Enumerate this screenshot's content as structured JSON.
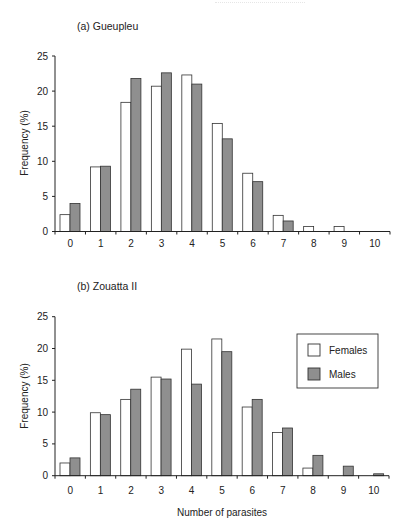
{
  "figure": {
    "xlabel": "Number of parasites",
    "legend": {
      "females": "Females",
      "males": "Males"
    },
    "colors": {
      "female_fill": "#ffffff",
      "male_fill": "#8f8f8f",
      "stroke": "#333333",
      "axis": "#222222"
    }
  },
  "chart_data": [
    {
      "type": "bar",
      "title": "(a) Gueupleu",
      "xlabel": "",
      "ylabel": "Frequency (%)",
      "ylim": [
        0,
        25
      ],
      "yticks": [
        0,
        5,
        10,
        15,
        20,
        25
      ],
      "categories": [
        "0",
        "1",
        "2",
        "3",
        "4",
        "5",
        "6",
        "7",
        "8",
        "9",
        "10"
      ],
      "series": [
        {
          "name": "Females",
          "values": [
            2.4,
            9.2,
            18.4,
            20.7,
            22.3,
            15.4,
            8.3,
            2.3,
            0.7,
            0.7,
            0
          ]
        },
        {
          "name": "Males",
          "values": [
            4.0,
            9.3,
            21.8,
            22.6,
            21.0,
            13.2,
            7.1,
            1.5,
            0,
            0,
            0
          ]
        }
      ],
      "legend": false,
      "grid": false
    },
    {
      "type": "bar",
      "title": "(b) Zouatta II",
      "xlabel": "Number of parasites",
      "ylabel": "Frequency (%)",
      "ylim": [
        0,
        25
      ],
      "yticks": [
        0,
        5,
        10,
        15,
        20,
        25
      ],
      "categories": [
        "0",
        "1",
        "2",
        "3",
        "4",
        "5",
        "6",
        "7",
        "8",
        "9",
        "10"
      ],
      "series": [
        {
          "name": "Females",
          "values": [
            2.0,
            9.9,
            12.0,
            15.5,
            19.9,
            21.5,
            10.8,
            6.8,
            1.2,
            0,
            0
          ]
        },
        {
          "name": "Males",
          "values": [
            2.8,
            9.6,
            13.6,
            15.2,
            14.4,
            19.5,
            12.0,
            7.5,
            3.2,
            1.5,
            0.3
          ]
        }
      ],
      "legend": true,
      "legend_position": "upper right",
      "grid": false
    }
  ]
}
